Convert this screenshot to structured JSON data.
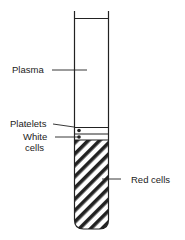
{
  "diagram": {
    "labels": {
      "plasma": "Plasma",
      "platelets": "Platelets",
      "white_cells_line1": "White",
      "white_cells_line2": "cells",
      "red_cells": "Red cells"
    },
    "colors": {
      "line": "#222222",
      "background": "#ffffff"
    }
  }
}
